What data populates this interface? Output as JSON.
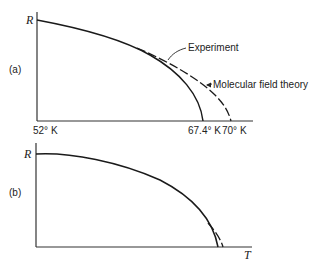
{
  "panel_a": {
    "label": "(a)",
    "y_axis_label": "R",
    "x_tick_start": "52° K",
    "x_tick_experiment": "67.4° K",
    "x_tick_theory": "70° K",
    "legend_experiment": "Experiment",
    "legend_theory": "Molecular field theory"
  },
  "panel_b": {
    "label": "(b)",
    "y_axis_label": "R",
    "x_axis_label": "T"
  },
  "colors": {
    "line": "#1a1a1a",
    "background": "#ffffff"
  }
}
